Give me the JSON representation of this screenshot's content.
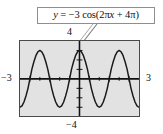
{
  "figure": {
    "kind": "graphing-calculator-screen",
    "callout": {
      "equation_text": "y = −3 cos(2πx + 4π)",
      "equation_parts": {
        "lhs": "y",
        "equals": "=",
        "amplitude": "−3",
        "function": "cos",
        "argument": "(2πx + 4π)"
      },
      "border_color": "#8e8e8e",
      "background_color": "#ffffff",
      "leader_line_color": "#7d7d7d"
    },
    "labels": {
      "top": "4",
      "bottom": "−4",
      "left": "−3",
      "right": "3"
    },
    "screen": {
      "border_color": "#4a4a4a",
      "background_color": "#e2e2e2",
      "curve_color": "#1a1a1a",
      "axis_color": "#111111"
    }
  },
  "chart_data": {
    "type": "line",
    "title": "y = −3 cos(2πx + 4π)",
    "equation": "y = -3*cos(2*pi*x + 4*pi)",
    "simplified_equation": "y = -3*cos(2*pi*x)",
    "xlabel": "x",
    "ylabel": "y",
    "xlim": [
      -3,
      3
    ],
    "ylim": [
      -4,
      4
    ],
    "xtick_labels": [
      "−3",
      "3"
    ],
    "ytick_labels": [
      "−4",
      "4"
    ],
    "xtick_step": 0.5,
    "ytick_step": 1,
    "grid": false,
    "legend": "none",
    "amplitude": 3,
    "period": 1,
    "phase_shift": -2,
    "vertical_shift": 0,
    "cycles_shown": 6,
    "series": [
      {
        "name": "y = −3 cos(2πx + 4π)",
        "color": "#1a1a1a",
        "x": [
          -3,
          -2.9,
          -2.8,
          -2.7,
          -2.6,
          -2.5,
          -2.4,
          -2.3,
          -2.2,
          -2.1,
          -2,
          -1.9,
          -1.8,
          -1.7,
          -1.6,
          -1.5,
          -1.4,
          -1.3,
          -1.2,
          -1.1,
          -1,
          -0.9,
          -0.8,
          -0.7,
          -0.6,
          -0.5,
          -0.4,
          -0.3,
          -0.2,
          -0.1,
          0,
          0.1,
          0.2,
          0.3,
          0.4,
          0.5,
          0.6,
          0.7,
          0.8,
          0.9,
          1,
          1.1,
          1.2,
          1.3,
          1.4,
          1.5,
          1.6,
          1.7,
          1.8,
          1.9,
          2,
          2.1,
          2.2,
          2.3,
          2.4,
          2.5,
          2.6,
          2.7,
          2.8,
          2.9,
          3
        ],
        "y": [
          -3,
          -2.43,
          -0.93,
          0.93,
          2.43,
          3,
          2.43,
          0.93,
          -0.93,
          -2.43,
          -3,
          -2.43,
          -0.93,
          0.93,
          2.43,
          3,
          2.43,
          0.93,
          -0.93,
          -2.43,
          -3,
          -2.43,
          -0.93,
          0.93,
          2.43,
          3,
          2.43,
          0.93,
          -0.93,
          -2.43,
          -3,
          -2.43,
          -0.93,
          0.93,
          2.43,
          3,
          2.43,
          0.93,
          -0.93,
          -2.43,
          -3,
          -2.43,
          -0.93,
          0.93,
          2.43,
          3,
          2.43,
          0.93,
          -0.93,
          -2.43,
          -3,
          -2.43,
          -0.93,
          0.93,
          2.43,
          3,
          2.43,
          0.93,
          -0.93,
          -2.43,
          -3
        ]
      }
    ],
    "maxima_x": [
      -2.5,
      -1.5,
      -0.5,
      0.5,
      1.5,
      2.5
    ],
    "maxima_y": 3,
    "minima_x": [
      -3,
      -2,
      -1,
      0,
      1,
      2,
      3
    ],
    "minima_y": -3
  }
}
